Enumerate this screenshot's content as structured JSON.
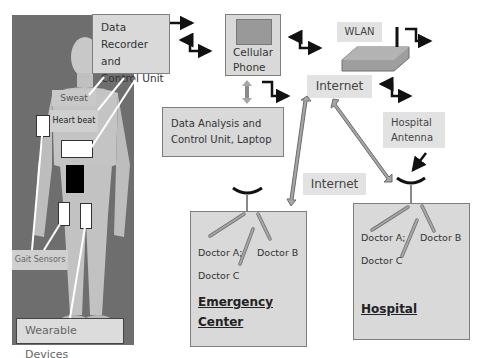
{
  "body_panel": {
    "labels": {
      "sweat": "Sweat",
      "heart_beat": "Heart beat",
      "gait_sensors": "Gait Sensors",
      "wearable_devices": "Wearable Devices"
    }
  },
  "data_recorder": {
    "lines": [
      "Data",
      "Recorder and",
      "Control Unit"
    ]
  },
  "cellular_phone": {
    "lines": [
      "Cellular",
      "Phone"
    ]
  },
  "wlan": {
    "label": "WLAN"
  },
  "internet_top": {
    "label": "Internet"
  },
  "internet_mid": {
    "label": "Internet"
  },
  "data_analysis": {
    "lines": [
      "Data Analysis and",
      "Control Unit, Laptop"
    ]
  },
  "hospital_antenna": {
    "lines": [
      "Hospital",
      "Antenna"
    ]
  },
  "emergency_center": {
    "doctors": {
      "a": "Doctor A;",
      "b": "Doctor B",
      "c": "Doctor C"
    },
    "title_lines": [
      "Emergency",
      "Center"
    ]
  },
  "hospital": {
    "doctors": {
      "a": "Doctor A;",
      "b": "Doctor B",
      "c": "Doctor C"
    },
    "title": "Hospital"
  },
  "colors": {
    "box_fill": "#d9d9d9",
    "label_fill": "#e2e2e2",
    "photo_bg": "#6e6e6e",
    "arrow_gray": "#a6a6a6",
    "arrow_dark": "#111111"
  }
}
